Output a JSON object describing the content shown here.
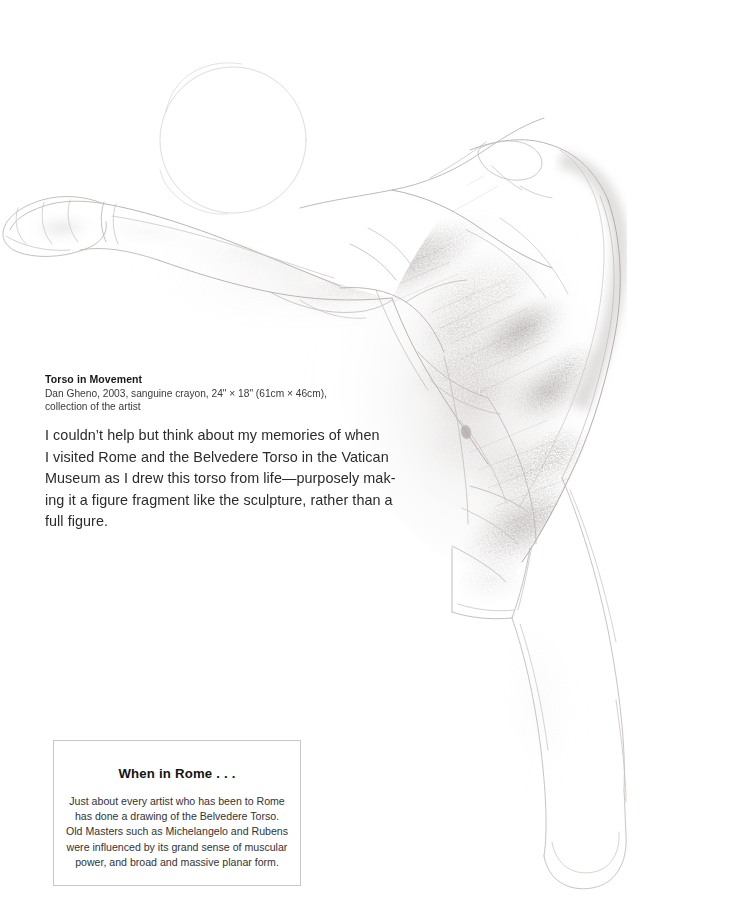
{
  "page": {
    "background_color": "#ffffff",
    "width": 751,
    "height": 915
  },
  "artwork": {
    "name": "torso-in-movement-drawing",
    "medium": "sanguine crayon",
    "description": "Faint sanguine crayon figure drawing of a male torso in movement, arms stretched to the left, body arching down and to the right, a figure fragment without head or lower legs",
    "line_color": "#b9b3b1",
    "shadow_color": "#8c8682",
    "highlight_color": "#d8d3d0"
  },
  "caption": {
    "title": "Torso in Movement",
    "credit_line_1": "Dan Gheno, 2003, sanguine crayon, 24\" × 18\" (61cm × 46cm),",
    "credit_line_2": "collection of the artist"
  },
  "body": {
    "lines": [
      "I couldn’t help but think about my memories of when",
      "I visited Rome and the Belvedere Torso in the Vatican",
      "Museum as I drew this torso from life—purposely mak-",
      "ing it a figure fragment like the sculpture, rather than a",
      "full figure."
    ]
  },
  "sidebar": {
    "heading": "When in Rome . . .",
    "lines": [
      "Just about every artist who has been to Rome",
      "has done a drawing of the Belvedere Torso.",
      "Old Masters such as Michelangelo and Rubens",
      "were influenced by its grand sense of muscular",
      "power, and broad and massive planar form."
    ],
    "border_color": "#c7c7c7"
  }
}
